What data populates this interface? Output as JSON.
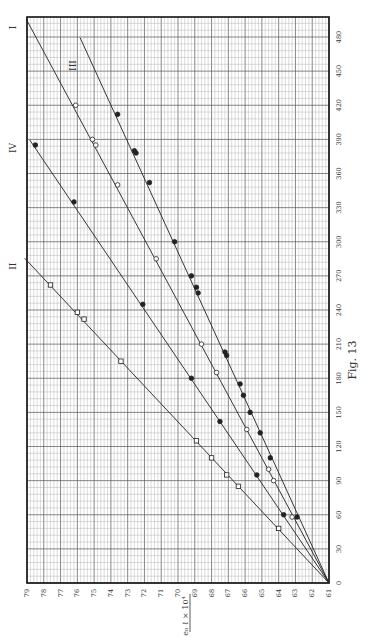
{
  "figure": {
    "caption": "Fig. 13",
    "orientation": "rotated 90° counter-clockwise on the page"
  },
  "chart_data": {
    "type": "scatter",
    "title": "",
    "caption": "Fig. 13",
    "xlabel": "",
    "ylabel": "e₀ ℓ × 10⁴",
    "xlim": [
      0,
      480
    ],
    "ylim": [
      61,
      79
    ],
    "x_ticks": [
      0,
      30,
      60,
      90,
      120,
      150,
      180,
      210,
      240,
      270,
      300,
      330,
      360,
      390,
      420,
      450,
      480
    ],
    "y_ticks": [
      61,
      62,
      63,
      64,
      65,
      66,
      67,
      68,
      69,
      70,
      71,
      72,
      73,
      74,
      75,
      76,
      77,
      78,
      79
    ],
    "grid": true,
    "legend": "none (lines labelled in-plot I, II, III, IV)",
    "series": [
      {
        "name": "I",
        "marker": "open circle",
        "line": {
          "x0": 0,
          "y0": 61,
          "x1": 492,
          "y1": 78.8
        },
        "points": [
          [
            58,
            63.2
          ],
          [
            90,
            64.3
          ],
          [
            100,
            64.6
          ],
          [
            135,
            65.9
          ],
          [
            185,
            67.7
          ],
          [
            210,
            68.6
          ],
          [
            285,
            71.3
          ],
          [
            350,
            73.6
          ],
          [
            385,
            74.9
          ],
          [
            390,
            75.1
          ],
          [
            420,
            76.1
          ]
        ]
      },
      {
        "name": "II",
        "marker": "open square",
        "line": {
          "x0": 0,
          "y0": 61,
          "x1": 282,
          "y1": 78.9
        },
        "points": [
          [
            48,
            64.0
          ],
          [
            85,
            66.4
          ],
          [
            95,
            67.1
          ],
          [
            110,
            68.0
          ],
          [
            125,
            68.9
          ],
          [
            195,
            73.4
          ],
          [
            232,
            75.6
          ],
          [
            238,
            76.0
          ],
          [
            262,
            77.6
          ]
        ]
      },
      {
        "name": "III",
        "marker": "filled circle",
        "line": {
          "x0": 0,
          "y0": 61,
          "x1": 476,
          "y1": 75.6
        },
        "points": [
          [
            58,
            62.9
          ],
          [
            110,
            64.5
          ],
          [
            132,
            65.1
          ],
          [
            150,
            65.7
          ],
          [
            165,
            66.1
          ],
          [
            175,
            66.3
          ],
          [
            200,
            67.1
          ],
          [
            203,
            67.2
          ],
          [
            255,
            68.8
          ],
          [
            260,
            68.9
          ],
          [
            270,
            69.2
          ],
          [
            300,
            70.2
          ],
          [
            352,
            71.7
          ],
          [
            378,
            72.5
          ],
          [
            380,
            72.6
          ],
          [
            412,
            73.6
          ]
        ]
      },
      {
        "name": "IV",
        "marker": "filled / crossed circle",
        "line": {
          "x0": 0,
          "y0": 61,
          "x1": 386,
          "y1": 78.6
        },
        "points": [
          [
            60,
            63.7
          ],
          [
            95,
            65.3
          ],
          [
            142,
            67.5
          ],
          [
            180,
            69.2
          ],
          [
            245,
            72.1
          ],
          [
            335,
            76.2
          ],
          [
            385,
            78.5
          ]
        ]
      }
    ],
    "annotations": [
      "I",
      "II",
      "III",
      "IV"
    ]
  }
}
